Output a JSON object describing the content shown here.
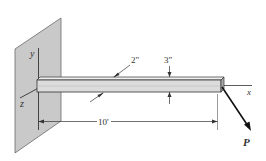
{
  "diagram": {
    "type": "engineering-statics-figure",
    "axes": {
      "x_label": "x",
      "y_label": "y",
      "z_label": "z"
    },
    "dimensions": {
      "beam_width": "2\"",
      "beam_height": "3\"",
      "beam_length": "10'"
    },
    "load": {
      "label": "P"
    },
    "colors": {
      "wall_fill": "#c8c8c8",
      "wall_edge": "#555555",
      "beam_top": "#e6e6e6",
      "beam_front": "#d4d4d4",
      "beam_end": "#a8a8a8",
      "line": "#222222"
    }
  }
}
